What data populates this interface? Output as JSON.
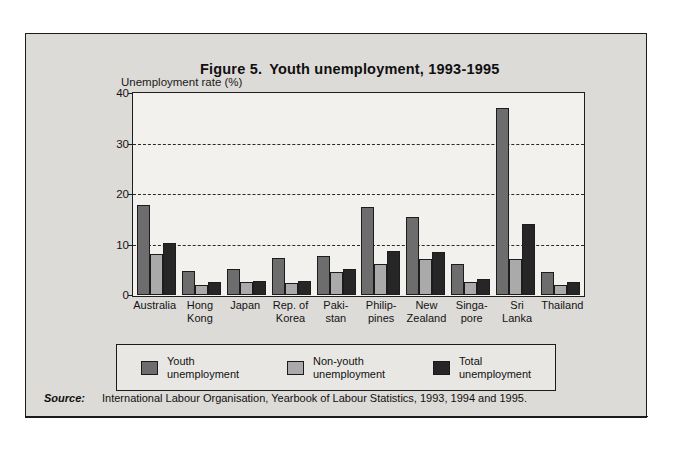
{
  "figure": {
    "title_prefix": "Figure 5.",
    "title_main": "Youth unemployment, 1993-1995",
    "title_full": "Figure 5.  Youth unemployment, 1993-1995"
  },
  "axis": {
    "caption": "Unemployment rate (%)"
  },
  "legend": {
    "items": [
      {
        "label_line1": "Youth",
        "label_line2": "unemployment",
        "color": "#6d6d6d"
      },
      {
        "label_line1": "Non-youth",
        "label_line2": "unemployment",
        "color": "#aaaaaa"
      },
      {
        "label_line1": "Total",
        "label_line2": "unemployment",
        "color": "#262626"
      }
    ]
  },
  "source": {
    "label": "Source:",
    "text": "International Labour Organisation, Yearbook of Labour Statistics, 1993, 1994 and 1995."
  },
  "colors": {
    "page_background": "#ffffff",
    "figure_background": "#dddbd8",
    "plot_background": "#f2f1ee",
    "legend_background": "#e9e7e4",
    "frame": "#1b1b1b",
    "youth": "#6d6d6d",
    "nonyouth": "#aaaaaa",
    "total": "#262626"
  },
  "chart_data": {
    "type": "bar",
    "xlabel": "",
    "ylabel": "Unemployment rate (%)",
    "ylim": [
      0,
      40
    ],
    "yticks": [
      0,
      10,
      20,
      30,
      40
    ],
    "grid": true,
    "grid_style": "dashed horizontal gridlines at 10, 20, 30",
    "legend_position": "below-axes",
    "categories": [
      "Australia",
      "Hong Kong",
      "Japan",
      "Rep. of Korea",
      "Pakistan",
      "Philippines",
      "New Zealand",
      "Singapore",
      "Sri Lanka",
      "Thailand"
    ],
    "category_label_lines": [
      [
        "Australia"
      ],
      [
        "Hong",
        "Kong"
      ],
      [
        "Japan"
      ],
      [
        "Rep. of",
        "Korea"
      ],
      [
        "Paki-",
        "stan"
      ],
      [
        "Philip-",
        "pines"
      ],
      [
        "New",
        "Zealand"
      ],
      [
        "Singa-",
        "pore"
      ],
      [
        "Sri",
        "Lanka"
      ],
      [
        "Thailand"
      ]
    ],
    "series": [
      {
        "name": "Youth unemployment",
        "color": "#6d6d6d",
        "values": [
          17.8,
          4.7,
          5.0,
          7.2,
          7.6,
          17.3,
          15.4,
          6.0,
          37.0,
          4.5
        ]
      },
      {
        "name": "Non-youth unemployment",
        "color": "#aaaaaa",
        "values": [
          8.0,
          1.9,
          2.4,
          2.2,
          4.4,
          6.0,
          7.0,
          2.5,
          7.1,
          1.9
        ]
      },
      {
        "name": "Total unemployment",
        "color": "#262626",
        "values": [
          10.2,
          2.4,
          2.6,
          2.7,
          5.0,
          8.6,
          8.4,
          3.0,
          14.0,
          2.4
        ]
      }
    ]
  }
}
